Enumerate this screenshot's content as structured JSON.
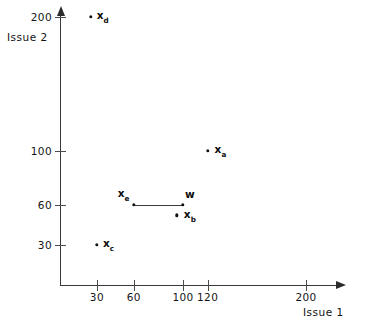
{
  "chart_data": {
    "type": "scatter",
    "title": "",
    "xlabel": "Issue 1",
    "ylabel": "Issue 2",
    "grid": false,
    "legend": "none",
    "xlim": [
      0,
      230
    ],
    "ylim": [
      0,
      215
    ],
    "xticks": [
      30,
      60,
      100,
      120,
      200
    ],
    "xtick_labels": [
      "30",
      "60",
      "100",
      "120",
      "200"
    ],
    "yticks": [
      30,
      60,
      100,
      200
    ],
    "ytick_labels": [
      "30",
      "60",
      "100",
      "200"
    ],
    "points": [
      {
        "label": "x",
        "sub": "d",
        "x": 25,
        "y": 200,
        "label_dx": 6,
        "label_dy": 0
      },
      {
        "label": "x",
        "sub": "a",
        "x": 120,
        "y": 100,
        "label_dx": 7,
        "label_dy": 0
      },
      {
        "label": "x",
        "sub": "e",
        "x": 60,
        "y": 60,
        "label_dx": -16,
        "label_dy": -10
      },
      {
        "label": "w",
        "sub": "",
        "x": 100,
        "y": 60,
        "label_dx": 2,
        "label_dy": -11
      },
      {
        "label": "x",
        "sub": "b",
        "x": 95,
        "y": 52,
        "label_dx": 7,
        "label_dy": 1
      },
      {
        "label": "x",
        "sub": "c",
        "x": 30,
        "y": 30,
        "label_dx": 6,
        "label_dy": 0
      }
    ],
    "segments": [
      {
        "name": "xe-to-w",
        "x1": 60,
        "y1": 60,
        "x2": 100,
        "y2": 60
      }
    ],
    "annotations": []
  },
  "colors": {
    "axis": "#3a3a3a",
    "point": "#111111",
    "text": "#121212",
    "background": "#ffffff"
  }
}
